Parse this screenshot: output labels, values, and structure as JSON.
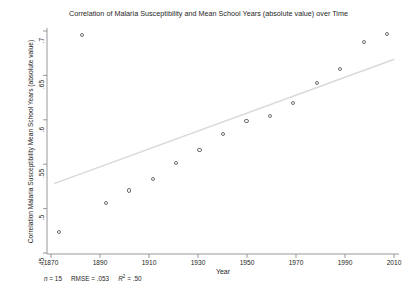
{
  "chart_data": {
    "type": "scatter",
    "title": "Correlation of Malaria Susceptibility and Mean School Years (absolute value) over Time",
    "xlabel": "Year",
    "ylabel": "Correlation Malaria Susceptibility Mean School Years (absolute value)",
    "xlim": [
      1865,
      2015
    ],
    "ylim": [
      0.445,
      0.705
    ],
    "xticks": [
      1870,
      1890,
      1910,
      1930,
      1950,
      1970,
      1990,
      2010
    ],
    "xtick_labels": [
      "1870",
      "1890",
      "1910",
      "1930",
      "1950",
      "1970",
      "1990",
      "2010"
    ],
    "yticks": [
      0.45,
      0.5,
      0.55,
      0.6,
      0.65,
      0.7
    ],
    "ytick_labels": [
      ".45",
      ".5",
      ".55",
      ".6",
      ".65",
      ".7"
    ],
    "grid": false,
    "legend": "none",
    "marker": "open-circle",
    "marker_color": "#6f6f72",
    "fit_line_color": "#d9d9dc",
    "x": [
      1870,
      1880,
      1890,
      1900,
      1910,
      1920,
      1930,
      1940,
      1950,
      1960,
      1970,
      1980,
      1990,
      2000,
      2010
    ],
    "y": [
      0.47,
      0.697,
      0.504,
      0.518,
      0.531,
      0.55,
      0.565,
      0.583,
      0.598,
      0.604,
      0.619,
      0.642,
      0.658,
      0.689,
      0.698
    ],
    "series": [
      {
        "name": "Correlation by year",
        "points": [
          {
            "x": 1870,
            "y": 0.47
          },
          {
            "x": 1880,
            "y": 0.697
          },
          {
            "x": 1890,
            "y": 0.504
          },
          {
            "x": 1900,
            "y": 0.518
          },
          {
            "x": 1910,
            "y": 0.531
          },
          {
            "x": 1920,
            "y": 0.55
          },
          {
            "x": 1930,
            "y": 0.565
          },
          {
            "x": 1940,
            "y": 0.583
          },
          {
            "x": 1950,
            "y": 0.598
          },
          {
            "x": 1960,
            "y": 0.604
          },
          {
            "x": 1970,
            "y": 0.619
          },
          {
            "x": 1980,
            "y": 0.642
          },
          {
            "x": 1990,
            "y": 0.658
          },
          {
            "x": 2000,
            "y": 0.689
          },
          {
            "x": 2010,
            "y": 0.698
          }
        ]
      }
    ],
    "fit_line": {
      "name": "linear fit",
      "x_start": 1868,
      "y_start": 0.526,
      "x_end": 2013,
      "y_end": 0.669
    },
    "annotations": {
      "n_label": "n",
      "n_value": "= 15",
      "rmse_label": "RMSE",
      "rmse_value": "=  .053",
      "r2_label": "R",
      "r2_sup": "2",
      "r2_value": "= .50"
    }
  }
}
